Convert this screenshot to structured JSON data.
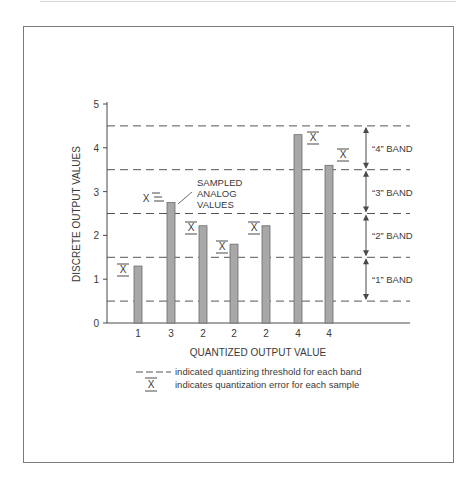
{
  "chart_data": {
    "type": "bar",
    "title": "",
    "xlabel": "QUANTIZED OUTPUT VALUE",
    "ylabel": "DISCRETE OUTPUT VALUES",
    "ylim": [
      0,
      5
    ],
    "yticks": [
      "0",
      "1",
      "2",
      "3",
      "4",
      "5"
    ],
    "categories": [
      "1",
      "3",
      "2",
      "2",
      "2",
      "4",
      "4"
    ],
    "values": [
      1.3,
      2.75,
      2.22,
      1.8,
      2.22,
      4.3,
      3.6
    ],
    "quantized_values": [
      1,
      3,
      2,
      2,
      2,
      4,
      4
    ],
    "thresholds": [
      0.5,
      1.5,
      2.5,
      3.5,
      4.5
    ],
    "bands": [
      {
        "label": "“4” BAND",
        "from": 3.5,
        "to": 4.5
      },
      {
        "label": "“3” BAND",
        "from": 2.5,
        "to": 3.5
      },
      {
        "label": "“2” BAND",
        "from": 1.5,
        "to": 2.5
      },
      {
        "label": "“1” BAND",
        "from": 0.5,
        "to": 1.5
      }
    ],
    "annotations": [
      "SAMPLED",
      "ANALOG",
      "VALUES"
    ],
    "error_marker": "X",
    "legend": [
      {
        "symbol": "— — —",
        "text": "indicated quantizing threshold for each band"
      },
      {
        "symbol": "X",
        "text": "indicates quantization error for each sample"
      }
    ],
    "grid": false,
    "bar_color": "#a8a8a8"
  }
}
